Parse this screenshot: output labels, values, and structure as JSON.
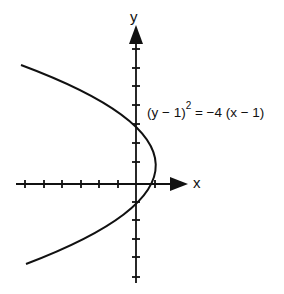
{
  "diagram": {
    "type": "parabola-graph",
    "axes": {
      "x_label": "x",
      "y_label": "y",
      "origin_px": [
        136,
        184
      ],
      "unit_px": 18.6,
      "x_ticks": [
        -6,
        -5,
        -4,
        -3,
        -2,
        -1,
        1
      ],
      "y_ticks": [
        7,
        6,
        5,
        4,
        3,
        2,
        1,
        -1,
        -2,
        -3,
        -4,
        -5
      ]
    },
    "equation": {
      "lhs_base": "(y − 1)",
      "exponent": "2",
      "rhs": " = −4 (x − 1)"
    },
    "curve": {
      "vertex": [
        1,
        1
      ],
      "opens": "left",
      "focal_param": -1,
      "y_intercepts": [
        3,
        -1
      ]
    },
    "colors": {
      "ink": "#111111",
      "background": "#ffffff"
    }
  }
}
